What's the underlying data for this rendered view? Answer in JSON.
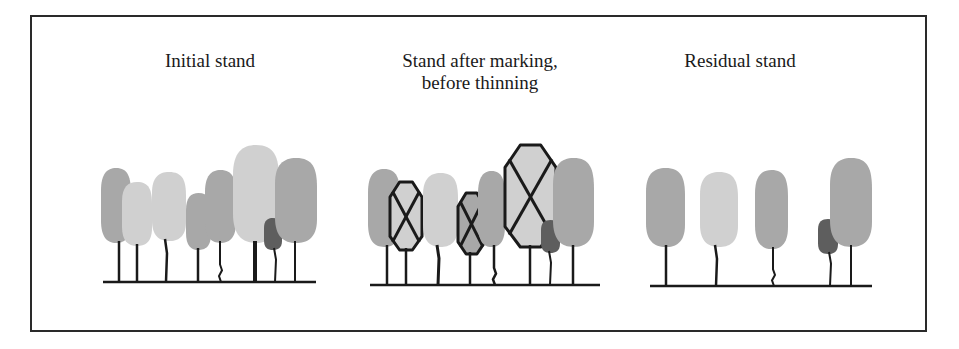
{
  "diagram": {
    "panels": [
      {
        "id": "initial",
        "caption_lines": [
          "Initial stand"
        ],
        "trees": [
          {
            "shade": "mid",
            "marked": false
          },
          {
            "shade": "light",
            "marked": false
          },
          {
            "shade": "light",
            "marked": false
          },
          {
            "shade": "mid",
            "marked": false
          },
          {
            "shade": "mid",
            "marked": false
          },
          {
            "shade": "light",
            "marked": false
          },
          {
            "shade": "dark",
            "marked": false
          },
          {
            "shade": "mid",
            "marked": false
          }
        ]
      },
      {
        "id": "marked",
        "caption_lines": [
          "Stand after marking,",
          "before thinning"
        ],
        "trees": [
          {
            "shade": "mid",
            "marked": false
          },
          {
            "shade": "light",
            "marked": true
          },
          {
            "shade": "light",
            "marked": false
          },
          {
            "shade": "mid",
            "marked": true
          },
          {
            "shade": "mid",
            "marked": false
          },
          {
            "shade": "light",
            "marked": true
          },
          {
            "shade": "dark",
            "marked": false
          },
          {
            "shade": "mid",
            "marked": false
          }
        ]
      },
      {
        "id": "residual",
        "caption_lines": [
          "Residual stand"
        ],
        "trees": [
          {
            "shade": "mid",
            "marked": false
          },
          {
            "shade": "light",
            "marked": false
          },
          {
            "shade": "mid",
            "marked": false
          },
          {
            "shade": "dark",
            "marked": false
          },
          {
            "shade": "mid",
            "marked": false
          }
        ]
      }
    ],
    "colors": {
      "light": "#d0d0d0",
      "mid": "#a8a8a8",
      "dark": "#5e5e5e",
      "line": "#1a1a1a",
      "frame": "#2a2a2a"
    }
  }
}
